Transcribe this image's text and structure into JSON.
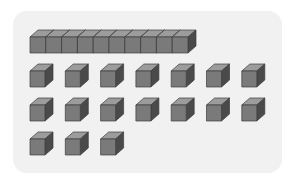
{
  "diagram": {
    "type": "base-ten-blocks",
    "represented_value": 27,
    "tens_rods": 1,
    "units_per_rod": 10,
    "unit_cubes": 17,
    "unit_rows": [
      7,
      7,
      3
    ]
  },
  "colors": {
    "background": "#ffffff",
    "panel": "#f1f1f1",
    "cube_front": "#7a7a7a",
    "cube_top": "#9c9c9c",
    "cube_side": "#4a4a4a",
    "edge": "#3c3c3c"
  }
}
